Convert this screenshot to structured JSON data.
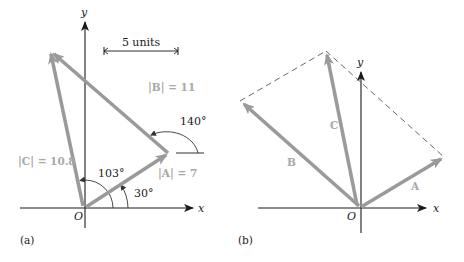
{
  "panel_a": {
    "label": "(a)",
    "axis_x": "x",
    "axis_y": "y",
    "origin": "O",
    "scale_bar": "5 units",
    "vector_A_label": "|A| = 7",
    "vector_B_label": "|B| = 11",
    "vector_C_label": "|C| = 10.8",
    "angle_A": "30°",
    "angle_C": "103°",
    "angle_B": "140°"
  },
  "panel_b": {
    "label": "(b)",
    "axis_x": "x",
    "axis_y": "y",
    "origin": "O",
    "vector_A_label": "A",
    "vector_B_label": "B",
    "vector_C_label": "C"
  },
  "colors": {
    "vector": "#9a9a9a",
    "vector_label": "#a8a8a8",
    "axis": "#1a1a1a"
  }
}
